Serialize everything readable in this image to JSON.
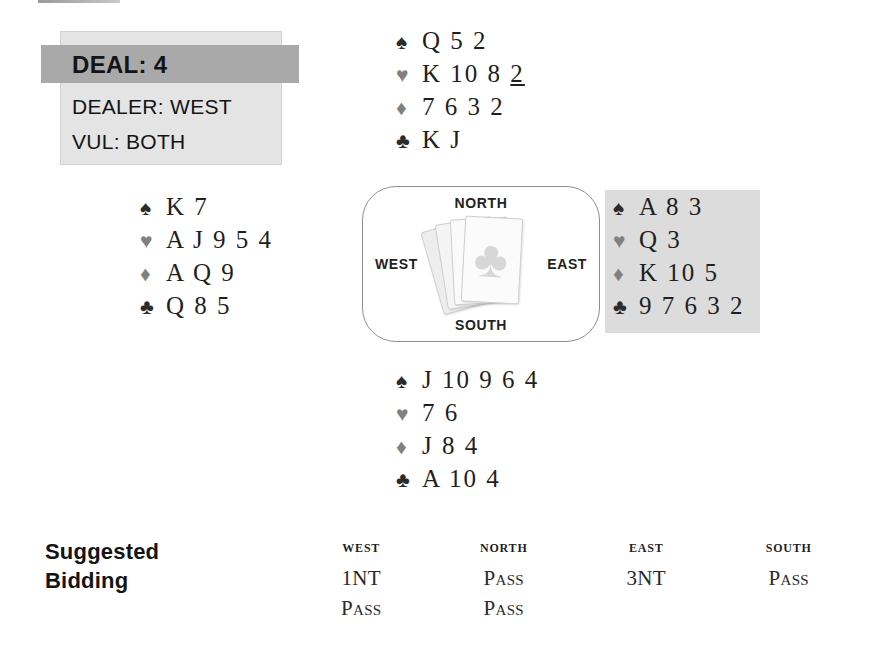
{
  "deal_info": {
    "deal_label": "DEAL:  4",
    "dealer_label": "DEALER: WEST",
    "vul_label": "VUL: BOTH",
    "banner_color": "#a9a9a9",
    "panel_color": "#e4e4e4"
  },
  "suits": {
    "spade": "♠",
    "heart": "♥",
    "diamond": "♦",
    "club": "♣"
  },
  "hands": {
    "north": {
      "position": "NORTH",
      "spades": "Q 5 2",
      "hearts_plain": "K 10 8 ",
      "hearts_underlined": "2",
      "diamonds": "7 6 3 2",
      "clubs": "K J"
    },
    "west": {
      "position": "WEST",
      "spades": "K 7",
      "hearts": "A J 9 5 4",
      "diamonds": "A Q 9",
      "clubs": "Q 8 5"
    },
    "east": {
      "position": "EAST",
      "spades": "A 8 3",
      "hearts": "Q 3",
      "diamonds": "K 10 5",
      "clubs": "9 7 6 3 2",
      "highlight_color": "#dcdcdc"
    },
    "south": {
      "position": "SOUTH",
      "spades": "J 10 9 6 4",
      "hearts": "7 6",
      "diamonds": "J 8 4",
      "clubs": "A 10 4"
    }
  },
  "compass": {
    "north": "NORTH",
    "south": "SOUTH",
    "west": "WEST",
    "east": "EAST",
    "card_face_glyph": "♣"
  },
  "bidding": {
    "title_line1": "Suggested",
    "title_line2": "Bidding",
    "columns": [
      "WEST",
      "NORTH",
      "EAST",
      "SOUTH"
    ],
    "rounds": [
      [
        "1NT",
        "Pass",
        "3NT",
        "Pass"
      ],
      [
        "Pass",
        "Pass",
        "",
        ""
      ]
    ]
  }
}
